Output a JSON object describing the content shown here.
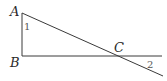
{
  "diagram": {
    "type": "geometry",
    "points": {
      "A": {
        "label": "A",
        "x": 22,
        "y": 13
      },
      "B": {
        "label": "B",
        "x": 22,
        "y": 56
      },
      "C": {
        "label": "C",
        "x": 120,
        "y": 56
      }
    },
    "angles": [
      {
        "label": "1",
        "at": "A"
      },
      {
        "label": "2",
        "at": "C",
        "note": "exterior angle beyond C between extended BC and extended AC"
      }
    ],
    "segments": [
      "AB",
      "BC (extended past C)",
      "AC (extended past C)"
    ],
    "colors": {
      "stroke": "#3a3a3a",
      "label": "#2a2a2a"
    }
  }
}
